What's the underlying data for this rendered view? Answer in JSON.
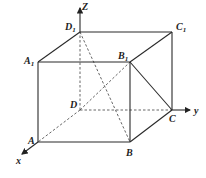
{
  "diagram": {
    "type": "cube-3d-coordinate",
    "vertices": {
      "A": {
        "label": "A",
        "sub": "",
        "x": 38,
        "y": 142
      },
      "B": {
        "label": "B",
        "sub": "",
        "x": 130,
        "y": 142
      },
      "C": {
        "label": "C",
        "sub": "",
        "x": 172,
        "y": 110
      },
      "D": {
        "label": "D",
        "sub": "",
        "x": 80,
        "y": 110
      },
      "A1": {
        "label": "A",
        "sub": "1",
        "x": 38,
        "y": 62
      },
      "B1": {
        "label": "B",
        "sub": "1",
        "x": 130,
        "y": 62
      },
      "C1": {
        "label": "C",
        "sub": "1",
        "x": 172,
        "y": 32
      },
      "D1": {
        "label": "D",
        "sub": "1",
        "x": 80,
        "y": 32
      }
    },
    "axes": {
      "z": {
        "label": "Z",
        "from": "D1",
        "tip": [
          80,
          8
        ]
      },
      "y": {
        "label": "y",
        "from": "C",
        "tip": [
          190,
          110
        ]
      },
      "x": {
        "label": "x",
        "from": "A",
        "tip": [
          22,
          154
        ]
      }
    },
    "solid_edges": [
      [
        "A",
        "B"
      ],
      [
        "B",
        "C"
      ],
      [
        "A",
        "A1"
      ],
      [
        "B",
        "B1"
      ],
      [
        "C",
        "C1"
      ],
      [
        "A1",
        "B1"
      ],
      [
        "B1",
        "C1"
      ],
      [
        "C1",
        "D1"
      ],
      [
        "D1",
        "A1"
      ],
      [
        "B1",
        "C"
      ]
    ],
    "dashed_edges": [
      [
        "D",
        "A"
      ],
      [
        "D",
        "C"
      ],
      [
        "D",
        "D1"
      ],
      [
        "D1",
        "B"
      ],
      [
        "D",
        "B1"
      ]
    ]
  }
}
